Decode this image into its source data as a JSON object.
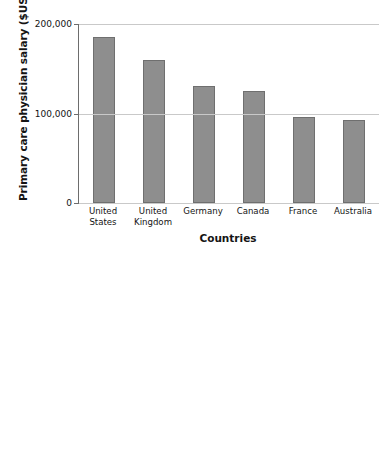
{
  "figure": {
    "background_color": "#ffffff",
    "bar_fill_color": "#8e8e8e",
    "bar_border_color": "#6f6f6f",
    "gridline_color": "#c9c9c9",
    "axis_color": "#6d6d6d"
  },
  "chart_data": [
    {
      "id": "primary-care",
      "type": "bar",
      "title": "",
      "xlabel": "Countries",
      "ylabel": "Primary care physician salary ($US)",
      "categories": [
        "United States",
        "United Kingdom",
        "Germany",
        "Canada",
        "France",
        "Australia"
      ],
      "category_lines": [
        [
          "United",
          "States"
        ],
        [
          "United",
          "Kingdom"
        ],
        [
          "Germany"
        ],
        [
          "Canada"
        ],
        [
          "France"
        ],
        [
          "Australia"
        ]
      ],
      "values": [
        186000,
        160000,
        131000,
        125000,
        96000,
        93000
      ],
      "ylim": [
        0,
        200000
      ],
      "yticks": [
        0,
        100000,
        200000
      ],
      "ytick_labels": [
        "0",
        "100,000",
        "200,000"
      ],
      "grid": true,
      "legend": "none"
    },
    {
      "id": "orthopedic",
      "type": "bar",
      "title": "",
      "xlabel": "",
      "ylabel": "Orthopedic physician salary ($US)",
      "categories": [
        "United States",
        "United Kingdom",
        "Germany",
        "Canada",
        "France",
        "Australia"
      ],
      "values": [
        443000,
        322000,
        210000,
        205000,
        190000,
        157000
      ],
      "ylim": [
        0,
        500000
      ],
      "yticks": [
        100000,
        200000,
        300000,
        400000,
        500000
      ],
      "ytick_labels": [
        "100,000",
        "200,000",
        "300,000",
        "400,000",
        "500,000"
      ],
      "grid": true,
      "legend": "none",
      "note_clipped": "bars extend below visible image edge"
    }
  ]
}
